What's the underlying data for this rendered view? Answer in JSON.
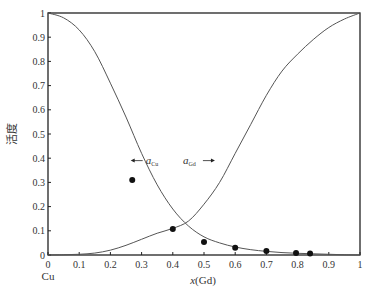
{
  "chart_data": {
    "type": "line",
    "title": "",
    "xlabel": "x(Gd)",
    "ylabel": "活度",
    "x_left_label": "Cu",
    "xlim": [
      0,
      1
    ],
    "ylim": [
      0,
      1
    ],
    "x_ticks": [
      "0",
      "0.1",
      "0.2",
      "0.3",
      "0.4",
      "0.5",
      "0.6",
      "0.7",
      "0.8",
      "0.9",
      "1"
    ],
    "y_ticks": [
      "0",
      "0.1",
      "0.2",
      "0.3",
      "0.4",
      "0.5",
      "0.6",
      "0.7",
      "0.8",
      "0.9",
      "1"
    ],
    "grid": false,
    "series": [
      {
        "name": "a_Cu",
        "type": "line",
        "x": [
          0,
          0.05,
          0.1,
          0.15,
          0.2,
          0.25,
          0.3,
          0.35,
          0.4,
          0.45,
          0.5,
          0.55,
          0.6,
          0.65,
          0.7,
          0.75,
          0.8,
          0.85,
          0.9,
          0.95,
          1
        ],
        "y": [
          1,
          0.98,
          0.93,
          0.84,
          0.71,
          0.57,
          0.42,
          0.29,
          0.19,
          0.12,
          0.075,
          0.05,
          0.033,
          0.022,
          0.015,
          0.01,
          0.007,
          0.005,
          0.003,
          0.001,
          0
        ]
      },
      {
        "name": "a_Gd",
        "type": "line",
        "x": [
          0,
          0.05,
          0.1,
          0.15,
          0.2,
          0.25,
          0.3,
          0.35,
          0.4,
          0.45,
          0.5,
          0.55,
          0.6,
          0.65,
          0.7,
          0.75,
          0.8,
          0.85,
          0.9,
          0.95,
          1
        ],
        "y": [
          0,
          0.001,
          0.003,
          0.008,
          0.02,
          0.04,
          0.065,
          0.09,
          0.11,
          0.14,
          0.21,
          0.3,
          0.42,
          0.54,
          0.66,
          0.76,
          0.83,
          0.89,
          0.94,
          0.975,
          1
        ]
      },
      {
        "name": "experimental a_Cu",
        "type": "scatter",
        "x": [
          0.27,
          0.4,
          0.5,
          0.6,
          0.7,
          0.795,
          0.84
        ],
        "y": [
          0.31,
          0.107,
          0.054,
          0.03,
          0.017,
          0.008,
          0.006
        ]
      }
    ],
    "annotations": [
      {
        "text": "a",
        "sub": "Cu",
        "arrow": "left",
        "x": 0.265,
        "y": 0.39
      },
      {
        "text": "a",
        "sub": "Gd",
        "arrow": "right",
        "x": 0.535,
        "y": 0.39
      }
    ]
  }
}
